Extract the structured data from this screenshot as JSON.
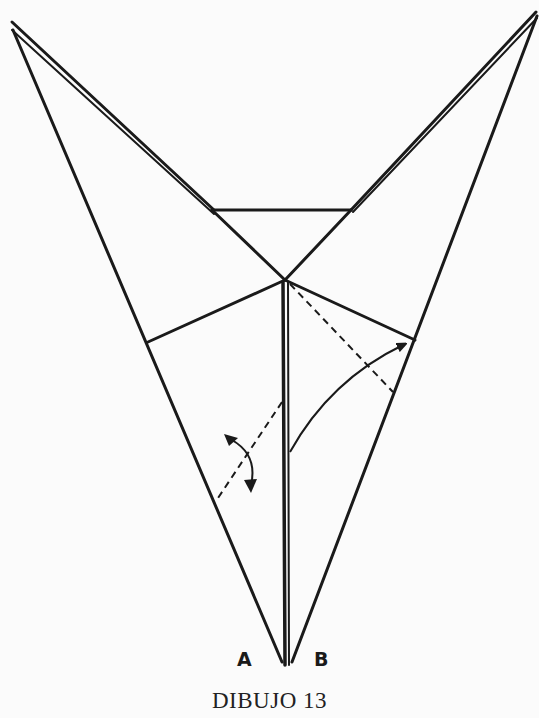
{
  "diagram": {
    "caption": "DIBUJO 13",
    "labels": {
      "a": "A",
      "b": "B"
    },
    "stroke_color": "#1a1a1a",
    "background": "#fbfbfb"
  }
}
